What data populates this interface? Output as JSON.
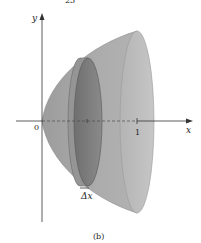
{
  "figure": {
    "caption": "(b)",
    "top_fragment": "23",
    "axes": {
      "x_label": "x",
      "y_label": "y",
      "origin_label": "0",
      "tick_label": "1"
    },
    "slice_label": "Δx",
    "colors": {
      "solid_body": "#a8a8a8",
      "solid_face": "#bdbdbd",
      "disk_face": "#7f7f7f",
      "disk_rim": "#9a9a9a",
      "axis": "#333333"
    }
  }
}
